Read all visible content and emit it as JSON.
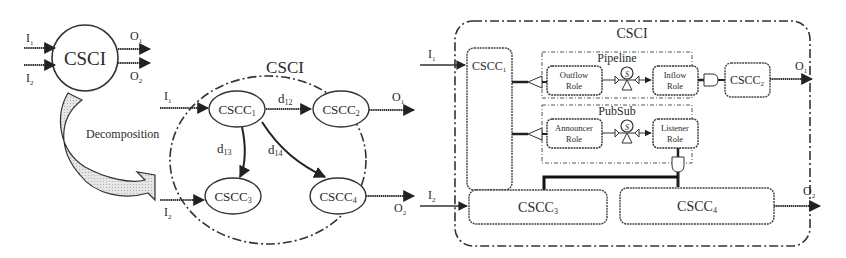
{
  "left_panel": {
    "csci_label": "CSCI",
    "inputs": [
      "I",
      "I"
    ],
    "input_subs": [
      "1",
      "2"
    ],
    "outputs": [
      "O",
      "O"
    ],
    "output_subs": [
      "1",
      "2"
    ],
    "decomposition_label": "Decomposition"
  },
  "middle_panel": {
    "title": "CSCI",
    "nodes": [
      {
        "id": "cscc1",
        "label": "CSCC",
        "sub": "1"
      },
      {
        "id": "cscc2",
        "label": "CSCC",
        "sub": "2"
      },
      {
        "id": "cscc3",
        "label": "CSCC",
        "sub": "3"
      },
      {
        "id": "cscc4",
        "label": "CSCC",
        "sub": "4"
      }
    ],
    "edges": [
      {
        "from": "cscc1",
        "to": "cscc2",
        "label": "d",
        "sub": "12"
      },
      {
        "from": "cscc1",
        "to": "cscc3",
        "label": "d",
        "sub": "13"
      },
      {
        "from": "cscc1",
        "to": "cscc4",
        "label": "d",
        "sub": "14"
      }
    ],
    "input_top": {
      "label": "I",
      "sub": "1"
    },
    "input_bottom": {
      "label": "I",
      "sub": "2"
    },
    "output_top": {
      "label": "O",
      "sub": "1"
    },
    "output_bottom": {
      "label": "O",
      "sub": "2"
    }
  },
  "right_panel": {
    "title": "CSCI",
    "cscc1": {
      "label": "CSCC",
      "sub": "1"
    },
    "cscc2": {
      "label": "CSCC",
      "sub": "2"
    },
    "cscc3": {
      "label": "CSCC",
      "sub": "3"
    },
    "cscc4": {
      "label": "CSCC",
      "sub": "4"
    },
    "pipeline": {
      "title": "Pipeline",
      "left_role": [
        "Outflow",
        "Role"
      ],
      "right_role": [
        "Inflow",
        "Role"
      ],
      "glyph": "S"
    },
    "pubsub": {
      "title": "PubSub",
      "left_role": [
        "Announcer",
        "Role"
      ],
      "right_role": [
        "Listener",
        "Role"
      ],
      "glyph": "S"
    },
    "input_top": {
      "label": "I",
      "sub": "1"
    },
    "input_bottom": {
      "label": "I",
      "sub": "2"
    },
    "output_top": {
      "label": "O",
      "sub": "1"
    },
    "output_bottom": {
      "label": "O",
      "sub": "2"
    }
  }
}
